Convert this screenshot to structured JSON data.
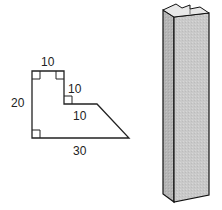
{
  "figure": {
    "cross_section": {
      "labels": {
        "top": "10",
        "step_vertical": "10",
        "step_horizontal": "10",
        "left": "20",
        "bottom": "30"
      },
      "right_angle_markers": 4,
      "stroke_color": "#222222"
    },
    "prism": {
      "front_color": "#c8c8c8",
      "side_color": "#b4b4b4",
      "top_color": "#e6e6e6",
      "stroke_color": "#111111"
    }
  }
}
